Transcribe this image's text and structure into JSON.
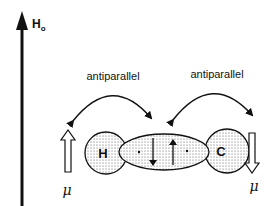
{
  "field": {
    "label_main": "H",
    "label_sub": "o"
  },
  "coupling": {
    "left_label": "antiparallel",
    "right_label": "antiparallel"
  },
  "atoms": {
    "left": "H",
    "right": "C"
  },
  "moments": {
    "left_label": "μ",
    "right_label": "μ",
    "left_direction": "up",
    "right_direction": "down"
  },
  "bond": {
    "electron_spins": [
      "down",
      "up"
    ]
  },
  "colors": {
    "ink": "#111111",
    "background": "#ffffff",
    "stipple": "#555555"
  }
}
